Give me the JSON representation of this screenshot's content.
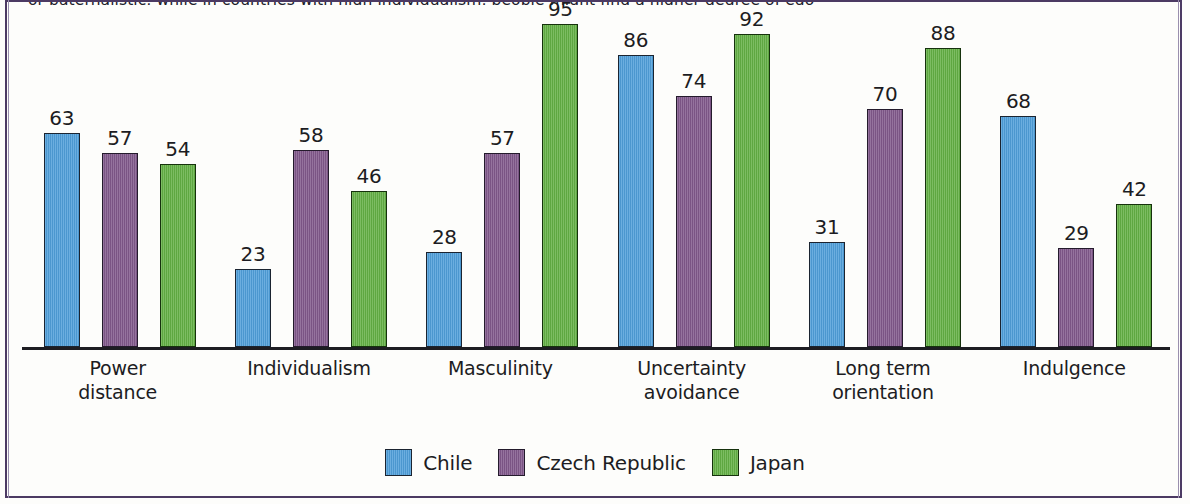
{
  "page": {
    "top_cut_text": "or paternalistic, while in countries with high individualism, people might find a higher degree of ego",
    "frame_color": "#4c3a63",
    "background": "#fdfdfb"
  },
  "chart_data": {
    "type": "bar",
    "title": "",
    "subtitle": "",
    "xlabel": "",
    "ylabel": "",
    "ylim": [
      0,
      100
    ],
    "grid": false,
    "legend_position": "bottom",
    "categories": [
      "Power distance",
      "Individualism",
      "Masculinity",
      "Uncertainty avoidance",
      "Long term orientation",
      "Indulgence"
    ],
    "category_lines": [
      [
        "Power",
        "distance"
      ],
      [
        "Individualism"
      ],
      [
        "Masculinity"
      ],
      [
        "Uncertainty",
        "avoidance"
      ],
      [
        "Long term",
        "orientation"
      ],
      [
        "Indulgence"
      ]
    ],
    "series": [
      {
        "name": "Chile",
        "color": "#4f9fda",
        "values": [
          63,
          23,
          28,
          86,
          31,
          68
        ]
      },
      {
        "name": "Czech Republic",
        "color": "#81588b",
        "values": [
          57,
          58,
          57,
          74,
          70,
          29
        ]
      },
      {
        "name": "Japan",
        "color": "#63b044",
        "values": [
          54,
          46,
          95,
          92,
          88,
          42
        ]
      }
    ]
  },
  "legend": {
    "items": [
      {
        "label": "Chile",
        "color": "#4f9fda",
        "key": "chile"
      },
      {
        "label": "Czech Republic",
        "color": "#81588b",
        "key": "czech"
      },
      {
        "label": "Japan",
        "color": "#63b044",
        "key": "japan"
      }
    ]
  }
}
